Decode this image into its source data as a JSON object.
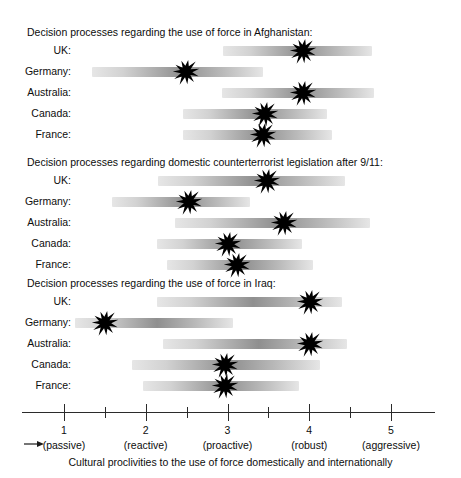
{
  "chart_data": {
    "type": "bar",
    "title": "Cultural proclivities to the use of force domestically and internationally",
    "xlabel": "Cultural proclivities to the use of force domestically and internationally",
    "ylabel": "",
    "xlim": [
      0.5,
      5.5
    ],
    "grid": false,
    "legend": "none",
    "axis": {
      "ticks": [
        {
          "value": 1,
          "label": "1",
          "descriptor": "(passive)"
        },
        {
          "value": 2,
          "label": "2",
          "descriptor": "(reactive)"
        },
        {
          "value": 3,
          "label": "3",
          "descriptor": "(proactive)"
        },
        {
          "value": 4,
          "label": "4",
          "descriptor": "(robust)"
        },
        {
          "value": 5,
          "label": "5",
          "descriptor": "(aggressive)"
        }
      ],
      "minor_ticks": [
        1.5,
        2.5,
        3.5,
        4.5
      ],
      "arrow_icon": "left-arrow-icon"
    },
    "panels": [
      {
        "title": "Decision processes regarding the use of force in Afghanistan:",
        "categories": [
          "UK:",
          "Germany:",
          "Australia:",
          "Canada:",
          "France:"
        ],
        "series": [
          {
            "name": "range_start",
            "values": [
              2.95,
              1.34,
              2.93,
              2.45,
              2.45
            ]
          },
          {
            "name": "range_end",
            "values": [
              4.77,
              3.43,
              4.79,
              4.22,
              4.28
            ]
          },
          {
            "name": "marker",
            "values": [
              3.92,
              2.49,
              3.92,
              3.46,
              3.44
            ]
          }
        ]
      },
      {
        "title": "Decision processes regarding domestic counterterrorist legislation after 9/11:",
        "categories": [
          "UK:",
          "Germany:",
          "Australia:",
          "Canada:",
          "France:"
        ],
        "series": [
          {
            "name": "range_start",
            "values": [
              2.15,
              1.59,
              2.36,
              2.14,
              2.26
            ]
          },
          {
            "name": "range_end",
            "values": [
              4.44,
              3.28,
              4.74,
              3.91,
              4.05
            ]
          },
          {
            "name": "marker",
            "values": [
              3.48,
              2.53,
              3.69,
              3.0,
              3.12
            ]
          }
        ]
      },
      {
        "title": "Decision processes regarding the use of force in Iraq:",
        "categories": [
          "UK:",
          "Germany:",
          "Australia:",
          "Canada:",
          "France:"
        ],
        "series": [
          {
            "name": "range_start",
            "values": [
              2.14,
              1.13,
              2.21,
              1.83,
              1.97
            ]
          },
          {
            "name": "range_end",
            "values": [
              4.4,
              3.07,
              4.46,
              4.13,
              3.88
            ]
          },
          {
            "name": "marker",
            "values": [
              4.01,
              1.5,
              4.01,
              2.97,
              2.97
            ]
          }
        ]
      }
    ],
    "colors": {
      "band_dark": "#8f8f8f",
      "band_light": "#e6e6e6",
      "marker": "#000000",
      "axis": "#2b2b2b",
      "text": "#0d0d0d",
      "background": "#ffffff"
    }
  },
  "panel1": {
    "title": "Decision processes regarding the use of force in Afghanistan:",
    "rows": [
      {
        "label": "UK:"
      },
      {
        "label": "Germany:"
      },
      {
        "label": "Australia:"
      },
      {
        "label": "Canada:"
      },
      {
        "label": "France:"
      }
    ]
  },
  "panel2": {
    "title": "Decision processes regarding domestic counterterrorist legislation after 9/11:",
    "rows": [
      {
        "label": "UK:"
      },
      {
        "label": "Germany:"
      },
      {
        "label": "Australia:"
      },
      {
        "label": "Canada:"
      },
      {
        "label": "France:"
      }
    ]
  },
  "panel3": {
    "title": "Decision processes regarding the use of force in Iraq:",
    "rows": [
      {
        "label": "UK:"
      },
      {
        "label": "Germany:"
      },
      {
        "label": "Australia:"
      },
      {
        "label": "Canada:"
      },
      {
        "label": "France:"
      }
    ]
  },
  "axis": {
    "labels": [
      "1",
      "2",
      "3",
      "4",
      "5"
    ],
    "descriptors": [
      "(passive)",
      "(reactive)",
      "(proactive)",
      "(robust)",
      "(aggressive)"
    ],
    "caption": "Cultural proclivities to the use of force domestically and internationally"
  }
}
